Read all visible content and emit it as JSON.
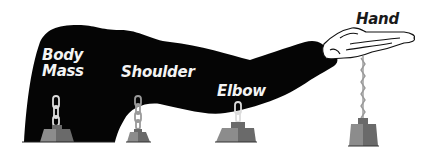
{
  "diagram": {
    "labels": {
      "body_mass_line1": "Body",
      "body_mass_line2": "Mass",
      "shoulder": "Shoulder",
      "elbow": "Elbow",
      "hand": "Hand"
    },
    "nodes": [
      {
        "id": "body-mass",
        "label": "Body Mass",
        "chain_x": 56,
        "weight_x": 56
      },
      {
        "id": "shoulder",
        "label": "Shoulder",
        "chain_x": 138,
        "weight_x": 138
      },
      {
        "id": "elbow",
        "label": "Elbow",
        "chain_x": 238,
        "weight_x": 238
      },
      {
        "id": "hand",
        "label": "Hand",
        "chain_x": 363,
        "weight_x": 363
      }
    ],
    "colors": {
      "arm": "#050505",
      "background": "#ffffff",
      "weight_light": "#8c8c8c",
      "weight_dark": "#6a6a6a",
      "chain": "#d8d8d8"
    }
  }
}
